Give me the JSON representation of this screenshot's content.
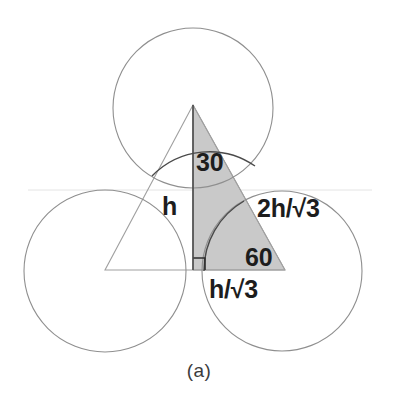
{
  "figure": {
    "caption": "(a)",
    "colors": {
      "shaded_fill": "#c9c9c9",
      "circle_stroke": "#8a8a8a",
      "triangle_stroke": "#9a9a9a",
      "text": "#1d1d1d",
      "background": "#ffffff"
    },
    "circles": [
      {
        "name": "top-circle",
        "cx": 193,
        "cy": 108,
        "r": 80
      },
      {
        "name": "bottom-left-circle",
        "cx": 105,
        "cy": 271,
        "r": 81
      },
      {
        "name": "bottom-right-circle",
        "cx": 282,
        "cy": 271,
        "r": 80
      }
    ],
    "triangle_centers": {
      "name": "equilateral-triangle",
      "apex": {
        "x": 193,
        "y": 105
      },
      "bottom_left": {
        "x": 105,
        "y": 270
      },
      "bottom_right": {
        "x": 285,
        "y": 270
      }
    },
    "shaded_triangle": {
      "name": "shaded-right-triangle",
      "apex": {
        "x": 193,
        "y": 105
      },
      "right_angle": {
        "x": 193,
        "y": 270
      },
      "base_right": {
        "x": 285,
        "y": 270
      }
    },
    "labels": {
      "angle_top": "30",
      "angle_base": "60",
      "side_vertical": "h",
      "side_hypotenuse": "2h/√3",
      "side_base": "h/√3"
    }
  }
}
